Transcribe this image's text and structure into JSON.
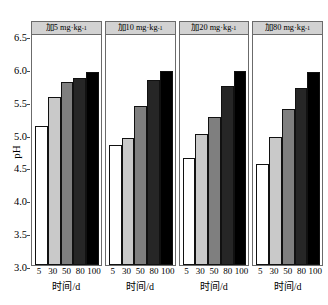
{
  "chart_data": {
    "type": "bar",
    "title": "",
    "subtitle": "",
    "xlabel": "时间/d",
    "ylabel": "pH",
    "ylim": [
      3.0,
      6.5
    ],
    "yticks": [
      3.0,
      3.5,
      4.0,
      4.5,
      5.0,
      5.5,
      6.0,
      6.5
    ],
    "ytick_labels": [
      "3.0",
      "3.5",
      "4.0",
      "4.5",
      "5.0",
      "5.5",
      "6.0",
      "6.5"
    ],
    "grid": false,
    "legend": "none",
    "categories": [
      "5",
      "30",
      "50",
      "80",
      "100"
    ],
    "panels": [
      {
        "title_prefix": "加",
        "title_dose": "5",
        "title_unit": "mg·kg",
        "title_exp": "-1",
        "title": "加5 mg·kg-1",
        "values": [
          5.11,
          5.56,
          5.78,
          5.84,
          5.94
        ]
      },
      {
        "title_prefix": "加",
        "title_dose": "10",
        "title_unit": "mg·kg",
        "title_exp": "-1",
        "title": "加10 mg·kg-1",
        "values": [
          4.83,
          4.93,
          5.42,
          5.82,
          5.96
        ]
      },
      {
        "title_prefix": "加",
        "title_dose": "20",
        "title_unit": "mg·kg",
        "title_exp": "-1",
        "title": "加20 mg·kg-1",
        "values": [
          4.63,
          5.0,
          5.26,
          5.73,
          5.96
        ]
      },
      {
        "title_prefix": "加",
        "title_dose": "80",
        "title_unit": "mg·kg",
        "title_exp": "-1",
        "title": "加80 mg·kg-1",
        "values": [
          4.53,
          4.95,
          5.37,
          5.69,
          5.93
        ]
      }
    ],
    "bar_colors": [
      "#ffffff",
      "#c9c9c9",
      "#7f7f7f",
      "#262626",
      "#000000"
    ],
    "bar_edge_color": "#111111",
    "panel_header_color": "#d2d2d2",
    "axis_color": "#6b6b6b"
  }
}
